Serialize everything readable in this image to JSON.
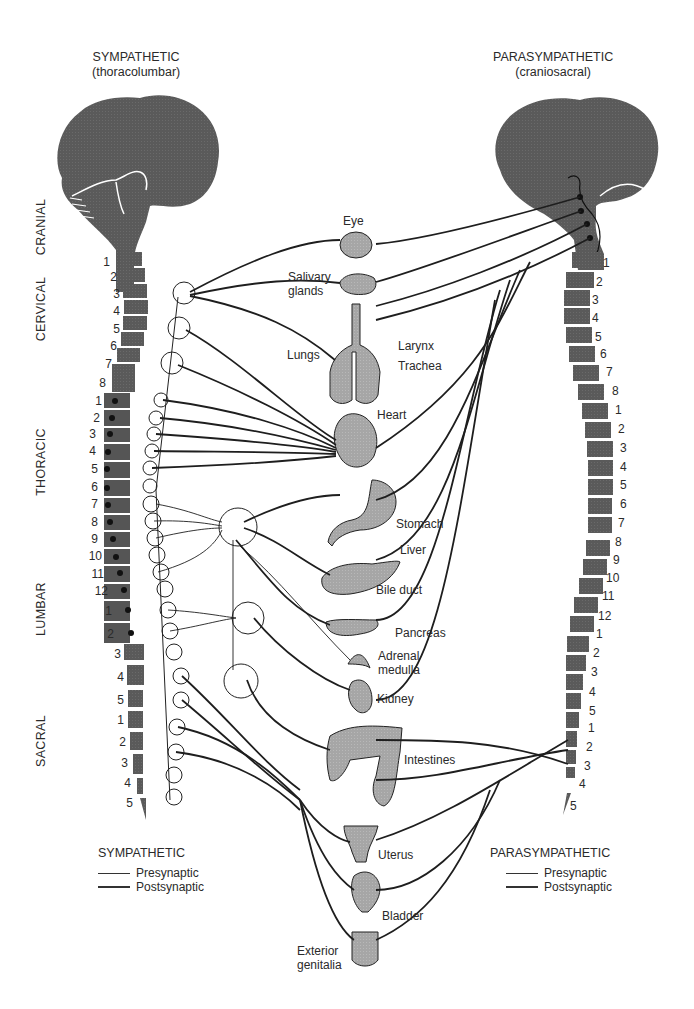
{
  "titles": {
    "sympathetic": "SYMPATHETIC",
    "sympathetic_sub": "(thoracolumbar)",
    "parasympathetic": "PARASYMPATHETIC",
    "parasympathetic_sub": "(craniosacral)"
  },
  "regions": [
    "CRANIAL",
    "CERVICAL",
    "THORACIC",
    "LUMBAR",
    "SACRAL"
  ],
  "left_segments": {
    "cervical": [
      "1",
      "2",
      "3",
      "4",
      "5",
      "6",
      "7",
      "8"
    ],
    "thoracic": [
      "1",
      "2",
      "3",
      "4",
      "5",
      "6",
      "7",
      "8",
      "9",
      "10",
      "11",
      "12"
    ],
    "lumbar": [
      "1",
      "2",
      "3",
      "4",
      "5"
    ],
    "sacral": [
      "1",
      "2",
      "3",
      "4",
      "5"
    ]
  },
  "right_segments": {
    "cervical": [
      "1",
      "2",
      "3",
      "4",
      "5",
      "6",
      "7",
      "8"
    ],
    "thoracic": [
      "1",
      "2",
      "3",
      "4",
      "5",
      "6",
      "7",
      "8",
      "9",
      "10",
      "11",
      "12"
    ],
    "lumbar": [
      "1",
      "2",
      "3",
      "4",
      "5"
    ],
    "sacral": [
      "1",
      "2",
      "3",
      "4",
      "5"
    ]
  },
  "organs": {
    "eye": "Eye",
    "salivary_1": "Salivary",
    "salivary_2": "glands",
    "lungs": "Lungs",
    "larynx": "Larynx",
    "trachea": "Trachea",
    "heart": "Heart",
    "stomach": "Stomach",
    "liver": "Liver",
    "bile_duct": "Bile duct",
    "pancreas": "Pancreas",
    "adrenal_1": "Adrenal",
    "adrenal_2": "medulla",
    "kidney": "Kidney",
    "intestines": "Intestines",
    "uterus": "Uterus",
    "bladder": "Bladder",
    "genitalia_1": "Exterior",
    "genitalia_2": "genitalia"
  },
  "legend_left": {
    "title": "SYMPATHETIC",
    "presynaptic": "Presynaptic",
    "postsynaptic": "Postsynaptic"
  },
  "legend_right": {
    "title": "PARASYMPATHETIC",
    "presynaptic": "Presynaptic",
    "postsynaptic": "Postsynaptic"
  },
  "colors": {
    "fill_dark": "#5e5e5e",
    "fill_organ": "#a9a9a9",
    "line": "#1e1e1e"
  }
}
